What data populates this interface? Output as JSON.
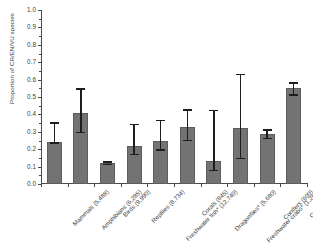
{
  "chart_data": {
    "type": "bar",
    "title": "",
    "xlabel": "",
    "ylabel": "Proportion of CR/EN/VU species",
    "ylim": [
      0.0,
      1.0
    ],
    "ytick_labels": [
      "0.0",
      "0.1",
      "0.2",
      "0.3",
      "0.4",
      "0.5",
      "0.6",
      "0.7",
      "0.8",
      "0.9",
      "1.0"
    ],
    "ytick_values": [
      0.0,
      0.1,
      0.2,
      0.3,
      0.4,
      0.5,
      0.6,
      0.7,
      0.8,
      0.9,
      1.0
    ],
    "grid": false,
    "legend": "none",
    "categories": [
      "Mammals (5,488)",
      "Amphibians (6,285)",
      "Birds (9,990)",
      "Reptiles (8,734)",
      "Freshwater fish* (12,740)",
      "Corals (845)",
      "Dragonflies* (5,680)",
      "Freshwater crabs* (1,261)",
      "Conifers (600)",
      "Cycads (299)"
    ],
    "values": [
      0.24,
      0.41,
      0.12,
      0.22,
      0.245,
      0.325,
      0.135,
      0.32,
      0.285,
      0.55
    ],
    "error_low": [
      0.24,
      0.3,
      0.115,
      0.175,
      0.2,
      0.255,
      0.08,
      0.15,
      0.265,
      0.515
    ],
    "error_high": [
      0.355,
      0.55,
      0.13,
      0.345,
      0.37,
      0.43,
      0.425,
      0.635,
      0.315,
      0.585
    ],
    "bar_color": "#737373",
    "error_color": "#1e1e1e",
    "axis_color": "#4a4a4a"
  }
}
